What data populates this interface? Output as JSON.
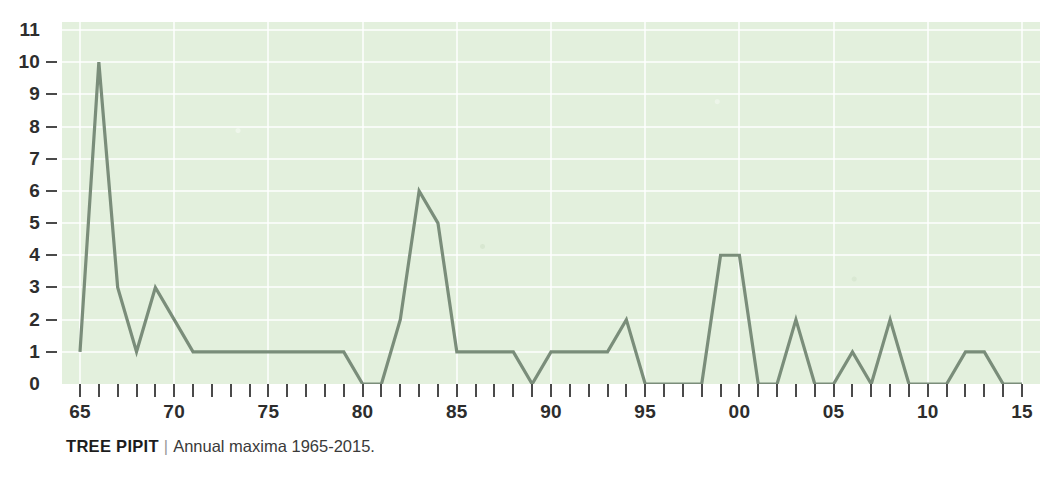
{
  "caption": {
    "species": "TREE PIPIT",
    "divider": "|",
    "text": "Annual maxima 1965-2015."
  },
  "colors": {
    "plot_background": "#e3f0dd",
    "gridline": "#ffffff",
    "series_line": "#7a8d7a",
    "axis_text": "#2d2d2d",
    "tick_mark": "#4a4a4a"
  },
  "chart_data": {
    "type": "line",
    "title": "TREE PIPIT",
    "subtitle": "Annual maxima 1965-2015.",
    "xlabel": "",
    "ylabel": "",
    "xlim": [
      1965,
      2015
    ],
    "ylim": [
      0,
      11
    ],
    "grid": true,
    "legend": null,
    "y_ticks": [
      0,
      1,
      2,
      3,
      4,
      5,
      6,
      7,
      8,
      9,
      10,
      11
    ],
    "y_tick_labels": [
      "0",
      "1",
      "2",
      "3",
      "4",
      "5",
      "6",
      "7",
      "8",
      "9",
      "10",
      "11"
    ],
    "x_tick_years": [
      1965,
      1970,
      1975,
      1980,
      1985,
      1990,
      1995,
      2000,
      2005,
      2010,
      2015
    ],
    "x_tick_labels": [
      "65",
      "70",
      "75",
      "80",
      "85",
      "90",
      "95",
      "00",
      "05",
      "10",
      "15"
    ],
    "x_minor_tick_interval": 1,
    "x": [
      1965,
      1966,
      1967,
      1968,
      1969,
      1970,
      1971,
      1972,
      1973,
      1974,
      1975,
      1976,
      1977,
      1978,
      1979,
      1980,
      1981,
      1982,
      1983,
      1984,
      1985,
      1986,
      1987,
      1988,
      1989,
      1990,
      1991,
      1992,
      1993,
      1994,
      1995,
      1996,
      1997,
      1998,
      1999,
      2000,
      2001,
      2002,
      2003,
      2004,
      2005,
      2006,
      2007,
      2008,
      2009,
      2010,
      2011,
      2012,
      2013,
      2014,
      2015
    ],
    "values": [
      1,
      10,
      3,
      1,
      3,
      2,
      1,
      1,
      1,
      1,
      1,
      1,
      1,
      1,
      1,
      0,
      0,
      2,
      6,
      5,
      1,
      1,
      1,
      1,
      0,
      1,
      1,
      1,
      1,
      2,
      0,
      0,
      0,
      0,
      4,
      4,
      0,
      0,
      2,
      0,
      0,
      1,
      0,
      2,
      0,
      0,
      0,
      1,
      1,
      0,
      0
    ]
  }
}
